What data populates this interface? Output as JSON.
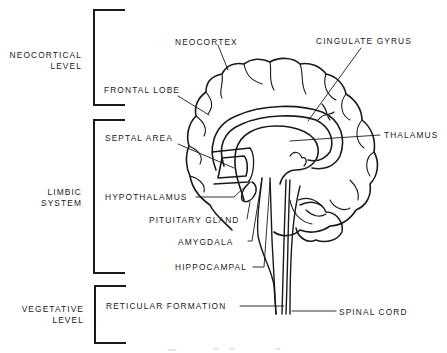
{
  "diagram": {
    "type": "anatomical-brain-sagittal-section",
    "levels": [
      {
        "id": "neocortical",
        "label": "NEOCORTICAL\nLEVEL"
      },
      {
        "id": "limbic",
        "label": "LIMBIC\nSYSTEM"
      },
      {
        "id": "vegetative",
        "label": "VEGETATIVE\nLEVEL"
      }
    ],
    "structures": {
      "neocortex": "NEOCORTEX",
      "cingulate_gyrus": "CINGULATE GYRUS",
      "frontal_lobe": "FRONTAL LOBE",
      "septal_area": "SEPTAL AREA",
      "thalamus": "THALAMUS",
      "hypothalamus": "HYPOTHALAMUS",
      "pituitary_gland": "PITUITARY GLAND",
      "amygdala": "AMYGDALA",
      "hippocampal": "HIPPOCAMPAL",
      "reticular_formation": "RETICULAR FORMATION",
      "spinal_cord": "SPINAL CORD"
    },
    "colors": {
      "ink": "#1a1a1a",
      "background": "#ffffff"
    }
  }
}
